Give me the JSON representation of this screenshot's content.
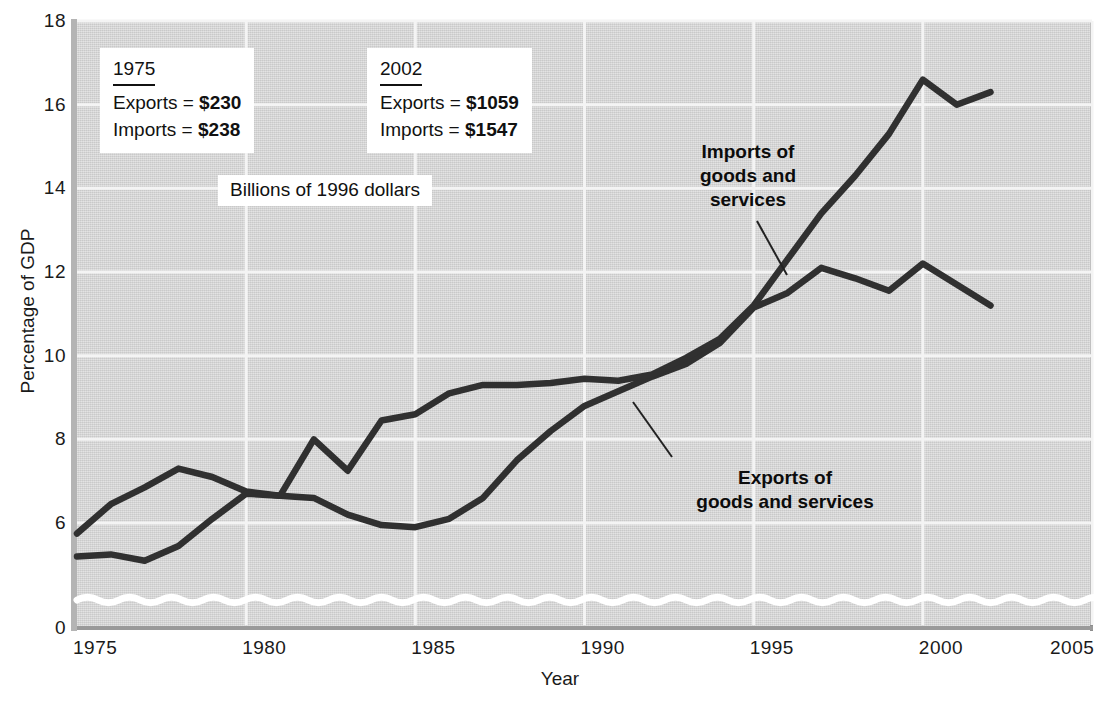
{
  "figure": {
    "axis_titles": {
      "x": "Year",
      "y": "Percentage of GDP"
    },
    "unit_note": "Billions of 1996 dollars",
    "callouts": [
      {
        "name": "callout-1975",
        "title": "1975",
        "rows": [
          {
            "label": "Exports = ",
            "value": "$230"
          },
          {
            "label": "Imports = ",
            "value": "$238"
          }
        ]
      },
      {
        "name": "callout-2002",
        "title": "2002",
        "rows": [
          {
            "label": "Exports = ",
            "value": "$1059"
          },
          {
            "label": "Imports = ",
            "value": "$1547"
          }
        ]
      }
    ],
    "series_annotations": [
      {
        "name": "imports-annotation",
        "line1": "Imports of",
        "line2": "goods and",
        "line3": "services"
      },
      {
        "name": "exports-annotation",
        "line1": "Exports of",
        "line2": "goods and services",
        "line3": ""
      }
    ],
    "colors": {
      "plot_background": "#d8d8d8",
      "line": "#303030",
      "gridline": "#f2f2f2",
      "axis": "#9a9a9a",
      "text": "#111111",
      "box_background": "#ffffff"
    }
  },
  "chart_data": {
    "type": "line",
    "xlabel": "Year",
    "ylabel": "Percentage of GDP",
    "xlim": [
      1975,
      2005
    ],
    "ylim": [
      0,
      18
    ],
    "y_axis_break": {
      "between": [
        0,
        6
      ],
      "style": "wavy-line",
      "note": "axis broken between 0 and ~5"
    },
    "grid": true,
    "legend": "inline-annotations",
    "xticks": [
      1975,
      1980,
      1985,
      1990,
      1995,
      2000,
      2005
    ],
    "yticks": [
      0,
      6,
      8,
      10,
      12,
      14,
      16,
      18
    ],
    "x": [
      1975,
      1976,
      1977,
      1978,
      1979,
      1980,
      1981,
      1982,
      1983,
      1984,
      1985,
      1986,
      1987,
      1988,
      1989,
      1990,
      1991,
      1992,
      1993,
      1994,
      1995,
      1996,
      1997,
      1998,
      1999,
      2000,
      2001,
      2002
    ],
    "series": [
      {
        "name": "Exports of goods and services",
        "values": [
          5.75,
          6.45,
          6.85,
          7.3,
          7.1,
          6.75,
          6.65,
          6.6,
          6.2,
          5.95,
          5.9,
          6.1,
          6.6,
          7.5,
          8.2,
          8.8,
          9.15,
          9.5,
          9.8,
          10.3,
          11.15,
          11.5,
          12.1,
          11.85,
          11.55,
          12.2,
          11.7,
          11.2
        ]
      },
      {
        "name": "Imports of goods and services",
        "values": [
          5.2,
          5.25,
          5.1,
          5.45,
          6.1,
          6.7,
          6.65,
          8.0,
          7.25,
          8.45,
          8.6,
          9.1,
          9.3,
          9.3,
          9.35,
          9.45,
          9.4,
          9.55,
          9.95,
          10.4,
          11.2,
          12.3,
          13.4,
          14.3,
          15.3,
          16.6,
          16.0,
          16.3
        ]
      }
    ],
    "annotations": [
      {
        "text": "Billions of 1996 dollars",
        "x": 1983,
        "y": 14.3
      },
      {
        "text": "1975: Exports = $230, Imports = $238",
        "x": 1976.5,
        "y": 16.8
      },
      {
        "text": "2002: Exports = $1059, Imports = $1547",
        "x": 1985,
        "y": 16.8
      }
    ]
  },
  "ticks": {
    "y": [
      {
        "label": "18",
        "value": 18
      },
      {
        "label": "16",
        "value": 16
      },
      {
        "label": "14",
        "value": 14
      },
      {
        "label": "12",
        "value": 12
      },
      {
        "label": "10",
        "value": 10
      },
      {
        "label": "8",
        "value": 8
      },
      {
        "label": "6",
        "value": 6
      },
      {
        "label": "0",
        "value": 0
      }
    ],
    "x": [
      {
        "label": "1975",
        "value": 1975
      },
      {
        "label": "1980",
        "value": 1980
      },
      {
        "label": "1985",
        "value": 1985
      },
      {
        "label": "1990",
        "value": 1990
      },
      {
        "label": "1995",
        "value": 1995
      },
      {
        "label": "2000",
        "value": 2000
      },
      {
        "label": "2005",
        "value": 2005
      }
    ]
  }
}
